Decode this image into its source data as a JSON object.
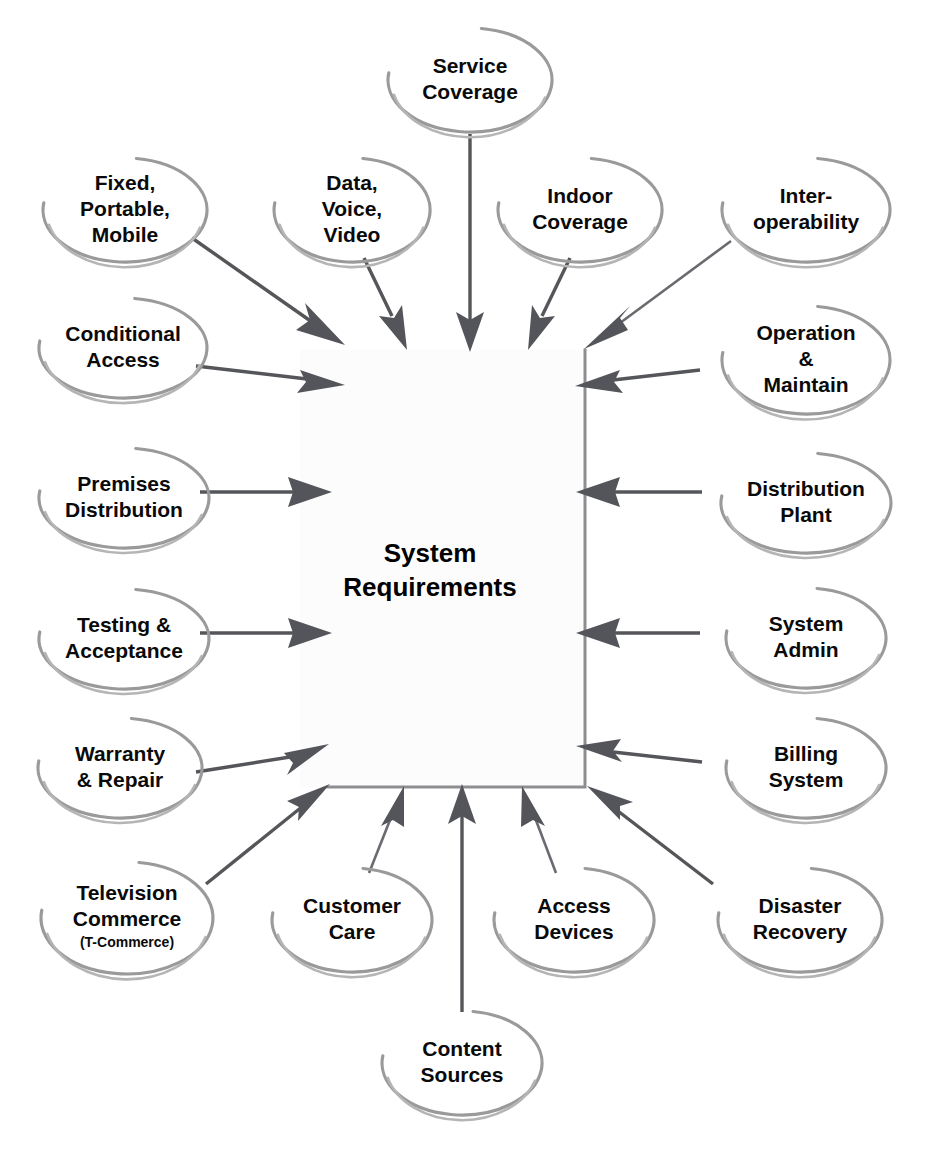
{
  "diagram": {
    "center": {
      "label_line1": "System",
      "label_line2": "Requirements"
    },
    "colors": {
      "balloon_stroke": "#9a9a9a",
      "arrow": "#54555a",
      "text": "#0a0a0a",
      "center_border": "#8d8e92",
      "background": "#ffffff"
    },
    "nodes": [
      {
        "id": "service-coverage",
        "lines": [
          "Service",
          "Coverage"
        ],
        "sub": "",
        "cx": 470,
        "cy": 80,
        "rx": 82,
        "ry": 52,
        "group": "top"
      },
      {
        "id": "fixed-portable-mobile",
        "lines": [
          "Fixed,",
          "Portable,",
          "Mobile"
        ],
        "sub": "",
        "cx": 125,
        "cy": 210,
        "rx": 82,
        "ry": 52,
        "group": "top-left"
      },
      {
        "id": "data-voice-video",
        "lines": [
          "Data,",
          "Voice,",
          "Video"
        ],
        "sub": "",
        "cx": 352,
        "cy": 210,
        "rx": 78,
        "ry": 52,
        "group": "top"
      },
      {
        "id": "indoor-coverage",
        "lines": [
          "Indoor",
          "Coverage"
        ],
        "sub": "",
        "cx": 580,
        "cy": 210,
        "rx": 82,
        "ry": 52,
        "group": "top"
      },
      {
        "id": "interoperability",
        "lines": [
          "Inter-",
          "operability"
        ],
        "sub": "",
        "cx": 806,
        "cy": 210,
        "rx": 84,
        "ry": 52,
        "group": "top-right"
      },
      {
        "id": "conditional-access",
        "lines": [
          "Conditional",
          "Access"
        ],
        "sub": "",
        "cx": 123,
        "cy": 348,
        "rx": 84,
        "ry": 50,
        "group": "left"
      },
      {
        "id": "operation-maintain",
        "lines": [
          "Operation",
          "&",
          "Maintain"
        ],
        "sub": "",
        "cx": 806,
        "cy": 360,
        "rx": 84,
        "ry": 54,
        "group": "right"
      },
      {
        "id": "premises-distribution",
        "lines": [
          "Premises",
          "Distribution"
        ],
        "sub": "",
        "cx": 124,
        "cy": 498,
        "rx": 85,
        "ry": 50,
        "group": "left"
      },
      {
        "id": "distribution-plant",
        "lines": [
          "Distribution",
          "Plant"
        ],
        "sub": "",
        "cx": 806,
        "cy": 503,
        "rx": 85,
        "ry": 50,
        "group": "right"
      },
      {
        "id": "testing-acceptance",
        "lines": [
          "Testing &",
          "Acceptance"
        ],
        "sub": "",
        "cx": 124,
        "cy": 639,
        "rx": 85,
        "ry": 50,
        "group": "left"
      },
      {
        "id": "system-admin",
        "lines": [
          "System",
          "Admin"
        ],
        "sub": "",
        "cx": 806,
        "cy": 638,
        "rx": 80,
        "ry": 50,
        "group": "right"
      },
      {
        "id": "warranty-repair",
        "lines": [
          "Warranty",
          "& Repair"
        ],
        "sub": "",
        "cx": 120,
        "cy": 768,
        "rx": 82,
        "ry": 50,
        "group": "left"
      },
      {
        "id": "billing-system",
        "lines": [
          "Billing",
          "System"
        ],
        "sub": "",
        "cx": 806,
        "cy": 768,
        "rx": 80,
        "ry": 50,
        "group": "right"
      },
      {
        "id": "television-commerce",
        "lines": [
          "Television",
          "Commerce"
        ],
        "sub": "(T-Commerce)",
        "cx": 127,
        "cy": 918,
        "rx": 86,
        "ry": 56,
        "group": "bottom-left"
      },
      {
        "id": "customer-care",
        "lines": [
          "Customer",
          "Care"
        ],
        "sub": "",
        "cx": 352,
        "cy": 920,
        "rx": 80,
        "ry": 52,
        "group": "bottom"
      },
      {
        "id": "access-devices",
        "lines": [
          "Access",
          "Devices"
        ],
        "sub": "",
        "cx": 574,
        "cy": 920,
        "rx": 80,
        "ry": 52,
        "group": "bottom"
      },
      {
        "id": "disaster-recovery",
        "lines": [
          "Disaster",
          "Recovery"
        ],
        "sub": "",
        "cx": 800,
        "cy": 920,
        "rx": 82,
        "ry": 52,
        "group": "bottom-right"
      },
      {
        "id": "content-sources",
        "lines": [
          "Content",
          "Sources"
        ],
        "sub": "",
        "cx": 462,
        "cy": 1063,
        "rx": 80,
        "ry": 52,
        "group": "bottom"
      }
    ],
    "connections": [
      {
        "from": "service-coverage",
        "to": "center",
        "kind": "straight-down"
      },
      {
        "from": "fixed-portable-mobile",
        "to": "center",
        "kind": "diagonal"
      },
      {
        "from": "data-voice-video",
        "to": "center",
        "kind": "diagonal"
      },
      {
        "from": "indoor-coverage",
        "to": "center",
        "kind": "diagonal"
      },
      {
        "from": "interoperability",
        "to": "center",
        "kind": "diagonal"
      },
      {
        "from": "conditional-access",
        "to": "center",
        "kind": "horizontal"
      },
      {
        "from": "operation-maintain",
        "to": "center",
        "kind": "horizontal"
      },
      {
        "from": "premises-distribution",
        "to": "center",
        "kind": "horizontal"
      },
      {
        "from": "distribution-plant",
        "to": "center",
        "kind": "horizontal"
      },
      {
        "from": "testing-acceptance",
        "to": "center",
        "kind": "horizontal"
      },
      {
        "from": "system-admin",
        "to": "center",
        "kind": "horizontal"
      },
      {
        "from": "warranty-repair",
        "to": "center",
        "kind": "horizontal"
      },
      {
        "from": "billing-system",
        "to": "center",
        "kind": "horizontal"
      },
      {
        "from": "television-commerce",
        "to": "center",
        "kind": "diagonal"
      },
      {
        "from": "customer-care",
        "to": "center",
        "kind": "diagonal"
      },
      {
        "from": "access-devices",
        "to": "center",
        "kind": "diagonal"
      },
      {
        "from": "disaster-recovery",
        "to": "center",
        "kind": "diagonal"
      },
      {
        "from": "content-sources",
        "to": "center",
        "kind": "straight-up"
      }
    ]
  }
}
